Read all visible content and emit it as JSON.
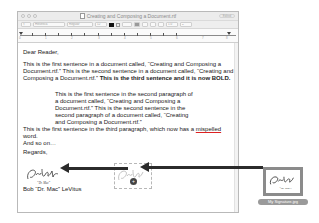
{
  "window": {
    "title": "Creating and Composing a Document.rtf",
    "edited_badge": "Edited",
    "toolbar": {
      "paragraph_style": "¶",
      "font_family": "Helvetica",
      "font_style": "Regular",
      "font_size": "12",
      "text_color": "#000000",
      "align_buttons": [
        "left",
        "center",
        "right",
        "justify"
      ],
      "line_spacing": "1.0",
      "list_style": "≡"
    },
    "ruler": {
      "labels": [
        "0",
        "1",
        "2",
        "3",
        "4",
        "5",
        "6",
        "7",
        "8"
      ]
    }
  },
  "document": {
    "salutation": "Dear Reader,",
    "paragraph1": {
      "plain": "This is the first sentence in a document called, “Creating and Composing a Document.rtf.” This is the second sentence in a document called, “Creating and Composing a Document.rtf.” ",
      "bold": "This is the third sentence and it is now BOLD."
    },
    "paragraph2": "This is the first sentence in the second paragraph of a document called, “Creating and Composing a Document.rtf.” This is the second sentence in the second paragraph of a document called, “Creating and Composing a Document.rtf.”",
    "paragraph3": {
      "before": "This is the first  sentence in the third paragraph, which now has a ",
      "misspelled": "mispelled",
      "after": " word.",
      "line2": "And so on…"
    },
    "closing": "Regards,",
    "signature_text": "Bob LeVitus",
    "signature_sub": "“Dr. Mac”",
    "signer_name": "Bob “Dr. Mac” LeVitus"
  },
  "drag": {
    "cursor_badge": "+",
    "file_icon_label": "My Signature.jpg",
    "arrow_color": "#2b2b2b"
  }
}
